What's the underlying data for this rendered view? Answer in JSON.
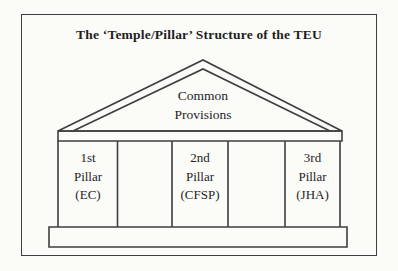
{
  "figure": {
    "title": "The ‘Temple/Pillar’ Structure of the TEU",
    "pediment": {
      "line1": "Common",
      "line2": "Provisions"
    },
    "pillars": [
      {
        "line1": "1st",
        "line2": "Pillar",
        "line3": "(EC)"
      },
      {
        "line1": "2nd",
        "line2": "Pillar",
        "line3": "(CFSP)"
      },
      {
        "line1": "3rd",
        "line2": "Pillar",
        "line3": "(JHA)"
      }
    ],
    "colors": {
      "line": "#3f3f3f",
      "background": "#fbfbf8",
      "text": "#1e1e1e"
    }
  }
}
